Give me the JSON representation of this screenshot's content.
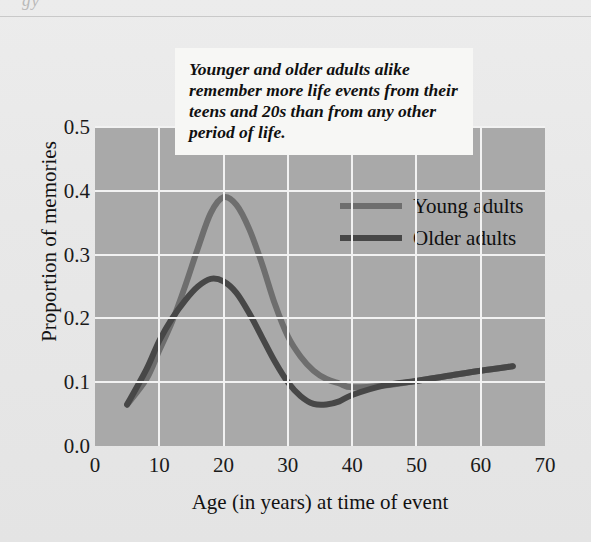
{
  "page": {
    "bleed_text": "gy",
    "background_color": "#e8e8e8"
  },
  "callout": {
    "text": "Younger and older adults alike remember more life events from their teens and 20s than from any other period of life."
  },
  "legend": {
    "position": "upper-right-inside-plot",
    "entries": [
      {
        "label": "Young adults",
        "color": "#6e6e6e"
      },
      {
        "label": "Older adults",
        "color": "#474747"
      }
    ]
  },
  "chart_data": {
    "type": "line",
    "title": "",
    "subtitle": "",
    "xlabel": "Age (in years) at time of event",
    "ylabel": "Proportion of memories",
    "xlim": [
      0,
      70
    ],
    "ylim": [
      0.0,
      0.5
    ],
    "xticks": [
      0,
      10,
      20,
      30,
      40,
      50,
      60,
      70
    ],
    "yticks": [
      0.0,
      0.1,
      0.2,
      0.3,
      0.4,
      0.5
    ],
    "xtick_labels": [
      "0",
      "10",
      "20",
      "30",
      "40",
      "50",
      "60",
      "70"
    ],
    "ytick_labels": [
      "0.0",
      "0.1",
      "0.2",
      "0.3",
      "0.4",
      "0.5"
    ],
    "grid": true,
    "grid_color": "#f2f2f2",
    "plot_background": "#a9a9a9",
    "legend_position": "upper right",
    "annotation": "Younger and older adults alike remember more life events from their teens and 20s than from any other period of life.",
    "series": [
      {
        "name": "Young adults",
        "color": "#6e6e6e",
        "x": [
          5,
          8,
          10,
          12,
          14,
          16,
          18,
          20,
          22,
          24,
          26,
          28,
          30,
          32,
          34,
          36,
          38,
          40,
          45,
          50,
          55,
          60,
          65
        ],
        "values": [
          0.065,
          0.105,
          0.15,
          0.195,
          0.25,
          0.31,
          0.365,
          0.39,
          0.378,
          0.34,
          0.285,
          0.222,
          0.172,
          0.14,
          0.118,
          0.105,
          0.098,
          0.092,
          0.095,
          0.102,
          0.11,
          0.118,
          0.125
        ]
      },
      {
        "name": "Older adults",
        "color": "#474747",
        "x": [
          5,
          8,
          10,
          12,
          14,
          16,
          18,
          20,
          22,
          24,
          26,
          28,
          30,
          32,
          34,
          36,
          38,
          40,
          45,
          50,
          55,
          60,
          65
        ],
        "values": [
          0.065,
          0.12,
          0.165,
          0.2,
          0.228,
          0.25,
          0.262,
          0.258,
          0.24,
          0.208,
          0.17,
          0.132,
          0.1,
          0.078,
          0.066,
          0.065,
          0.07,
          0.08,
          0.095,
          0.102,
          0.11,
          0.118,
          0.125
        ]
      }
    ],
    "peaks": [
      {
        "series": "Young adults",
        "x": 20,
        "y": 0.39
      },
      {
        "series": "Older adults",
        "x": 18,
        "y": 0.262
      }
    ],
    "minima": [
      {
        "series": "Older adults",
        "x": 35,
        "y": 0.065
      },
      {
        "series": "Young adults",
        "x": 40,
        "y": 0.092
      }
    ]
  }
}
